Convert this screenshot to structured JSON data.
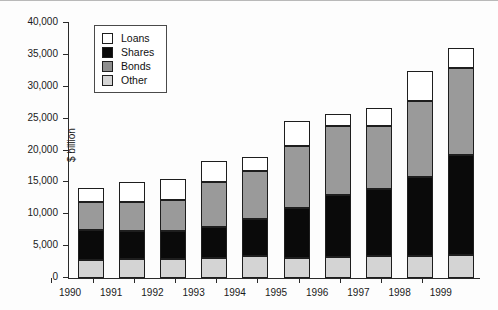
{
  "chart_data": {
    "type": "bar",
    "stacked": true,
    "title": "",
    "xlabel": "",
    "ylabel": "$ billion",
    "ylim": [
      0,
      40000
    ],
    "ytick_values": [
      0,
      5000,
      10000,
      15000,
      20000,
      25000,
      30000,
      35000,
      40000
    ],
    "ytick_labels": [
      "0",
      "5,000",
      "10,000",
      "15,000",
      "20,000",
      "25,000",
      "30,000",
      "35,000",
      "40,000"
    ],
    "grid": false,
    "legend_position": "top-left-inside",
    "categories": [
      "1990",
      "1991",
      "1992",
      "1993",
      "1994",
      "1995",
      "1996",
      "1997",
      "1998",
      "1999"
    ],
    "series": [
      {
        "name": "Other",
        "color": "#d4d4d4",
        "values": [
          2800,
          3000,
          3000,
          3100,
          3500,
          3200,
          3300,
          3400,
          3500,
          3600
        ]
      },
      {
        "name": "Shares",
        "color": "#0a0a0a",
        "values": [
          4700,
          4400,
          4300,
          4900,
          5700,
          7800,
          9700,
          10600,
          12300,
          15700
        ]
      },
      {
        "name": "Bonds",
        "color": "#9a9a9a",
        "values": [
          4500,
          4600,
          5000,
          7100,
          7600,
          9700,
          10800,
          9900,
          11900,
          13700
        ]
      },
      {
        "name": "Loans",
        "color": "#ffffff",
        "values": [
          2100,
          3000,
          3200,
          3200,
          2200,
          3900,
          1900,
          2800,
          4800,
          3100
        ]
      }
    ],
    "totals": [
      14100,
      15000,
      15500,
      18300,
      19000,
      24600,
      25700,
      26700,
      32500,
      36100
    ]
  },
  "legend": {
    "items": [
      {
        "label": "Loans",
        "swatch": "loans-swatch"
      },
      {
        "label": "Shares",
        "swatch": "shares-swatch"
      },
      {
        "label": "Bonds",
        "swatch": "bonds-swatch"
      },
      {
        "label": "Other",
        "swatch": "other-swatch"
      }
    ]
  }
}
